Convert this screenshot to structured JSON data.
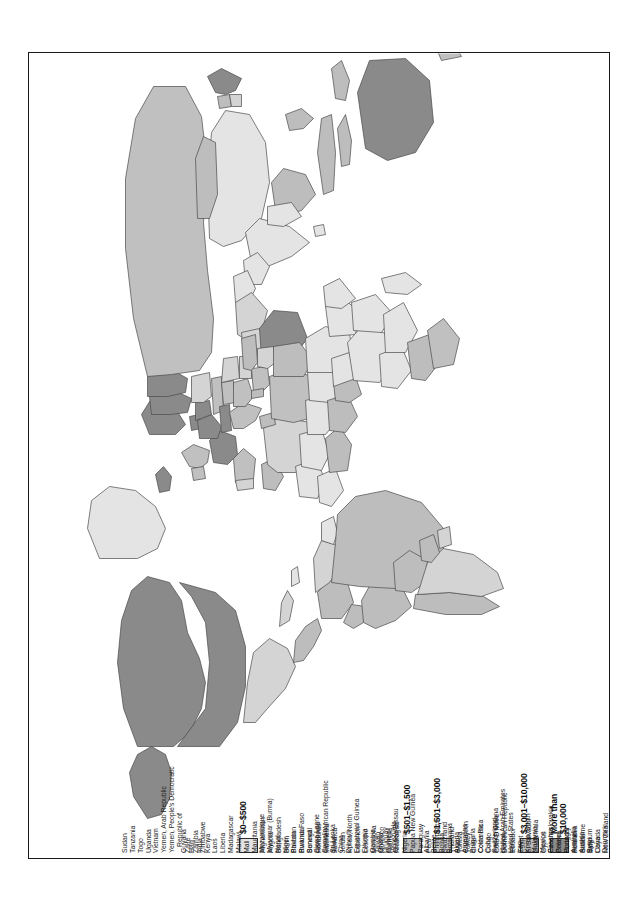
{
  "map": {
    "title": "World map of GNP per capita",
    "projection": "world-robinson-rotated",
    "orientation": "rotated-90-counterclockwise",
    "colors": {
      "more_than_10000": "#8a8a8a",
      "3001_10000": "#c0c0c0",
      "1501_3000": "#d4d4d4",
      "501_1500": "#bdbdbd",
      "0_500": "#e4e4e4",
      "border": "#4a4a4a",
      "frame": "#1a1a1a",
      "background": "#ffffff"
    }
  },
  "legend": {
    "categories": [
      {
        "label": "More than\n$10,000",
        "swatch": "#8a8a8a",
        "countries": [
          "Australia",
          "Austria",
          "Belgium",
          "Canada",
          "Denmark",
          "Finland",
          "France",
          "Germany, East",
          "Germany, West",
          "Iceland",
          "Japan",
          "Kuwait",
          "Luxembourg",
          "Netherlands",
          "Norway",
          "Qatar",
          "Saudi Arabia",
          "Sweden",
          "Switzerland",
          "United Arab Emirates",
          "United States"
        ]
      },
      {
        "label": "$3,001–$10,000",
        "swatch": "#c0c0c0",
        "countries": [
          "Cyprus",
          "Czechoslovakia",
          "Greece",
          "Hungary",
          "Ireland",
          "Israel",
          "Italy",
          "Libya",
          "New Zealand",
          "Oman",
          "South Africa",
          "Soviet Union",
          "Spain",
          "United Kingdom",
          "Yugoslavia"
        ]
      },
      {
        "label": "$1,501–$3,000",
        "swatch": "#d4d4d4",
        "countries": [
          "Algeria",
          "Argentina",
          "Bulgaria",
          "Costa Rica",
          "Cuba",
          "French Guiana",
          "Gabon",
          "Iran",
          "Iraq",
          "Korea, South",
          "Malaysia",
          "Mexico",
          "Panama",
          "Poland",
          "Portugal",
          "Romania",
          "Suriname",
          "Syria",
          "Taiwan",
          "Uruguay",
          "Venezuela"
        ]
      },
      {
        "label": "$501–$1,500",
        "swatch": "#bdbdbd",
        "countries": [
          "Albania",
          "Belize",
          "Bolivia",
          "Botswana",
          "Brazil",
          "Cameroon",
          "Chile",
          "Colombia",
          "Congo",
          "Côte D'Ivoire",
          "Dominican Republic",
          "Ecuador",
          "Egypt",
          "El Salvador",
          "Guatemala",
          "Honduras",
          "Indonesia",
          "Jamaica",
          "Jordan",
          "Korea, North",
          "Lebanon",
          "Lesotho",
          "Mongolia",
          "Morocco",
          "Namibia",
          "Nicaragua",
          "Nigeria",
          "Papua New Guinea",
          "Paraguay",
          "Peru",
          "Philippines",
          "Swaziland",
          "Thailand",
          "Tunisia",
          "Turkey"
        ]
      },
      {
        "label": "$0–$500",
        "swatch": "#e4e4e4",
        "countries": [
          "Afghanistan",
          "Angola",
          "Bangladesh",
          "Benin",
          "Bhutan",
          "Burkina Faso",
          "Burundi",
          "Cambodia",
          "Central African Republic",
          "Chad",
          "China",
          "Djibouti",
          "Equatorial Guinea",
          "Ethiopia",
          "Gambia",
          "Ghana",
          "Guinea",
          "Guinea-Bissau",
          "Guyana",
          "Haiti",
          "India",
          "Kenya",
          "Laos",
          "Liberia",
          "Madagascar",
          "Malawi",
          "Mali",
          "Mauritania",
          "Mozambique",
          "Myanmar (Burma)",
          "Nepal",
          "Niger",
          "Pakistan",
          "Rwanda",
          "Senegal",
          "Sierra Leone",
          "Somalia",
          "Sri Lanka",
          "Sudan",
          "Tanzania",
          "Togo",
          "Uganda",
          "Vietnam",
          "Yemen, Arab Republic",
          "Yemen, People's Democratic",
          "Republic of",
          "Zaire",
          "Zambia",
          "Zimbabwe"
        ]
      }
    ],
    "columns": [
      {
        "category_index": 0,
        "label": "More than\n$10,000",
        "swatch": "#8a8a8a",
        "show_swatch": true,
        "items": [
          {
            "text": "Australia",
            "cont": false
          },
          {
            "text": "Austria",
            "cont": false
          },
          {
            "text": "Belgium",
            "cont": false
          },
          {
            "text": "Canada",
            "cont": false
          },
          {
            "text": "Denmark",
            "cont": false
          },
          {
            "text": "Finland",
            "cont": false
          },
          {
            "text": "France",
            "cont": false
          },
          {
            "text": "Germany, East",
            "cont": false
          },
          {
            "text": "Germany, West",
            "cont": false
          },
          {
            "text": "Iceland",
            "cont": false
          },
          {
            "text": "Japan",
            "cont": false
          },
          {
            "text": "Kuwait",
            "cont": false
          },
          {
            "text": "Luxembourg",
            "cont": false
          },
          {
            "text": "Netherlands",
            "cont": false
          },
          {
            "text": "Norway",
            "cont": false
          },
          {
            "text": "Qatar",
            "cont": false
          },
          {
            "text": "Saudi Arabia",
            "cont": false
          },
          {
            "text": "Sweden",
            "cont": false
          }
        ]
      },
      {
        "category_index": 1,
        "label": "$3,001–$10,000",
        "swatch": "#c0c0c0",
        "show_swatch": true,
        "pre_items": [
          {
            "text": "Switzerland",
            "cont": false
          },
          {
            "text": "United Arab Emirates",
            "cont": false
          },
          {
            "text": "United States",
            "cont": false
          }
        ],
        "items": [
          {
            "text": "Cyprus",
            "cont": false
          },
          {
            "text": "Czechoslovakia",
            "cont": false
          },
          {
            "text": "Greece",
            "cont": false
          },
          {
            "text": "Hungary",
            "cont": false
          },
          {
            "text": "Ireland",
            "cont": false
          },
          {
            "text": "Israel",
            "cont": false
          },
          {
            "text": "Italy",
            "cont": false
          },
          {
            "text": "Libya",
            "cont": false
          },
          {
            "text": "New Zealand",
            "cont": false
          },
          {
            "text": "Oman",
            "cont": false
          },
          {
            "text": "South Africa",
            "cont": false
          },
          {
            "text": "Soviet Union",
            "cont": false
          },
          {
            "text": "Spain",
            "cont": false
          },
          {
            "text": "United Kingdom",
            "cont": false
          },
          {
            "text": "Yugoslavia",
            "cont": false
          }
        ]
      },
      {
        "category_index": 2,
        "label": "$1,501–$3,000",
        "swatch": "#d4d4d4",
        "show_swatch": true,
        "pre_items": [],
        "items": [
          {
            "text": "Algeria",
            "cont": false
          },
          {
            "text": "Argentina",
            "cont": false
          },
          {
            "text": "Bulgaria",
            "cont": false
          },
          {
            "text": "Costa Rica",
            "cont": false
          },
          {
            "text": "Cuba",
            "cont": false
          },
          {
            "text": "French Guiana",
            "cont": false
          },
          {
            "text": "Gabon",
            "cont": false
          },
          {
            "text": "Iran",
            "cont": false
          },
          {
            "text": "Iraq",
            "cont": false
          },
          {
            "text": "Korea, South",
            "cont": false
          },
          {
            "text": "Malaysia",
            "cont": false
          },
          {
            "text": "Mexico",
            "cont": false
          },
          {
            "text": "Panama",
            "cont": false
          },
          {
            "text": "Poland",
            "cont": false
          },
          {
            "text": "Portugal",
            "cont": false
          },
          {
            "text": "Romania",
            "cont": false
          },
          {
            "text": "Suriname",
            "cont": false
          },
          {
            "text": "Syria",
            "cont": false
          }
        ]
      },
      {
        "category_index": 3,
        "label": "$501–$1,500",
        "swatch": "#bdbdbd",
        "show_swatch": true,
        "pre_items": [
          {
            "text": "Taiwan",
            "cont": false
          },
          {
            "text": "Uruguay",
            "cont": false
          },
          {
            "text": "Venezuela",
            "cont": false
          }
        ],
        "items": [
          {
            "text": "Albania",
            "cont": false
          },
          {
            "text": "Belize",
            "cont": false
          },
          {
            "text": "Bolivia",
            "cont": false
          },
          {
            "text": "Botswana",
            "cont": false
          },
          {
            "text": "Brazil",
            "cont": false
          },
          {
            "text": "Cameroon",
            "cont": false
          },
          {
            "text": "Chile",
            "cont": false
          },
          {
            "text": "Colombia",
            "cont": false
          },
          {
            "text": "Congo",
            "cont": false
          },
          {
            "text": "Côte D'Ivoire",
            "cont": false
          },
          {
            "text": "Dominican Republic",
            "cont": false
          },
          {
            "text": "Ecuador",
            "cont": false
          },
          {
            "text": "Egypt",
            "cont": false
          },
          {
            "text": "El Salvador",
            "cont": false
          },
          {
            "text": "Guatemala",
            "cont": false
          }
        ]
      },
      {
        "category_index": 3,
        "label": "",
        "swatch": "",
        "show_swatch": false,
        "pre_items": [],
        "items": [
          {
            "text": "Honduras",
            "cont": false
          },
          {
            "text": "Indonesia",
            "cont": false
          },
          {
            "text": "Jamaica",
            "cont": false
          },
          {
            "text": "Jordan",
            "cont": false
          },
          {
            "text": "Korea, North",
            "cont": false
          },
          {
            "text": "Lebanon",
            "cont": false
          },
          {
            "text": "Lesotho",
            "cont": false
          },
          {
            "text": "Mongolia",
            "cont": false
          },
          {
            "text": "Morocco",
            "cont": false
          },
          {
            "text": "Namibia",
            "cont": false
          },
          {
            "text": "Nicaragua",
            "cont": false
          },
          {
            "text": "Nigeria",
            "cont": false
          },
          {
            "text": "Papua New Guinea",
            "cont": false
          },
          {
            "text": "Paraguay",
            "cont": false
          },
          {
            "text": "Peru",
            "cont": false
          },
          {
            "text": "Philippines",
            "cont": false
          },
          {
            "text": "Swaziland",
            "cont": false
          },
          {
            "text": "Thailand",
            "cont": false
          },
          {
            "text": "Tunisia",
            "cont": false
          },
          {
            "text": "Turkey",
            "cont": false
          }
        ]
      },
      {
        "category_index": 4,
        "label": "$0–$500",
        "swatch": "#e4e4e4",
        "show_swatch": true,
        "pre_items": [],
        "items": [
          {
            "text": "Afghanistan",
            "cont": false
          },
          {
            "text": "Angola",
            "cont": false
          },
          {
            "text": "Bangladesh",
            "cont": false
          },
          {
            "text": "Benin",
            "cont": false
          },
          {
            "text": "Bhutan",
            "cont": false
          },
          {
            "text": "Burkina Faso",
            "cont": false
          },
          {
            "text": "Burundi",
            "cont": false
          },
          {
            "text": "Cambodia",
            "cont": false
          },
          {
            "text": "Central African Republic",
            "cont": false
          },
          {
            "text": "Chad",
            "cont": false
          },
          {
            "text": "China",
            "cont": false
          },
          {
            "text": "Djibouti",
            "cont": false
          },
          {
            "text": "Equatorial Guinea",
            "cont": false
          },
          {
            "text": "Ethiopia",
            "cont": false
          },
          {
            "text": "Gambia",
            "cont": false
          },
          {
            "text": "Ghana",
            "cont": false
          },
          {
            "text": "Guinea",
            "cont": false
          },
          {
            "text": "Guinea-Bissau",
            "cont": false
          }
        ]
      },
      {
        "category_index": 4,
        "label": "",
        "swatch": "",
        "show_swatch": false,
        "pre_items": [],
        "items": [
          {
            "text": "Guyana",
            "cont": false
          },
          {
            "text": "Haiti",
            "cont": false
          },
          {
            "text": "India",
            "cont": false
          },
          {
            "text": "Kenya",
            "cont": false
          },
          {
            "text": "Laos",
            "cont": false
          },
          {
            "text": "Liberia",
            "cont": false
          },
          {
            "text": "Madagascar",
            "cont": false
          },
          {
            "text": "Malawi",
            "cont": false
          },
          {
            "text": "Mali",
            "cont": false
          },
          {
            "text": "Mauritania",
            "cont": false
          },
          {
            "text": "Mozambique",
            "cont": false
          },
          {
            "text": "Myanmar (Burma)",
            "cont": false
          },
          {
            "text": "Nepal",
            "cont": false
          },
          {
            "text": "Niger",
            "cont": false
          },
          {
            "text": "Pakistan",
            "cont": false
          },
          {
            "text": "Rwanda",
            "cont": false
          },
          {
            "text": "Senegal",
            "cont": false
          },
          {
            "text": "Sierra Leone",
            "cont": false
          },
          {
            "text": "Somalia",
            "cont": false
          },
          {
            "text": "Sri Lanka",
            "cont": false
          }
        ]
      },
      {
        "category_index": 4,
        "label": "",
        "swatch": "",
        "show_swatch": false,
        "pre_items": [],
        "items": [
          {
            "text": "Sudan",
            "cont": false
          },
          {
            "text": "Tanzania",
            "cont": false
          },
          {
            "text": "Togo",
            "cont": false
          },
          {
            "text": "Uganda",
            "cont": false
          },
          {
            "text": "Vietnam",
            "cont": false
          },
          {
            "text": "Yemen, Arab Republic",
            "cont": false
          },
          {
            "text": "Yemen, People's Democratic",
            "cont": false
          },
          {
            "text": "Republic of",
            "cont": true
          },
          {
            "text": "Zaire",
            "cont": false
          },
          {
            "text": "Zambia",
            "cont": false
          },
          {
            "text": "Zimbabwe",
            "cont": false
          }
        ]
      }
    ]
  }
}
